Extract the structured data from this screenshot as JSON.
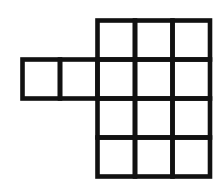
{
  "figure": {
    "name": "polyomino-grid-figure",
    "background_color": "#ffffff",
    "stroke_color": "#111111",
    "fill_color": "#ffffff",
    "stroke_width": 4.6,
    "cell_width": 37.5,
    "cell_height": 39,
    "total_cells": 14,
    "origin_x": 22.5,
    "origin_y": 20.5,
    "grid_columns": 5,
    "grid_rows": 4,
    "column_x": [
      22.5,
      60,
      97.5,
      135,
      172.5,
      210
    ],
    "row_y": [
      20.5,
      59.5,
      98.5,
      137.5,
      176.5
    ],
    "occupancy": [
      [
        0,
        0,
        1,
        1,
        1
      ],
      [
        1,
        1,
        1,
        1,
        1
      ],
      [
        0,
        0,
        1,
        1,
        1
      ],
      [
        0,
        0,
        1,
        1,
        1
      ]
    ],
    "cells": [
      {
        "label": "r1c3",
        "row": 0,
        "col": 2
      },
      {
        "label": "r1c4",
        "row": 0,
        "col": 3
      },
      {
        "label": "r1c5",
        "row": 0,
        "col": 4
      },
      {
        "label": "r2c1",
        "row": 1,
        "col": 0
      },
      {
        "label": "r2c2",
        "row": 1,
        "col": 1
      },
      {
        "label": "r2c3",
        "row": 1,
        "col": 2
      },
      {
        "label": "r2c4",
        "row": 1,
        "col": 3
      },
      {
        "label": "r2c5",
        "row": 1,
        "col": 4
      },
      {
        "label": "r3c3",
        "row": 2,
        "col": 2
      },
      {
        "label": "r3c4",
        "row": 2,
        "col": 3
      },
      {
        "label": "r3c5",
        "row": 2,
        "col": 4
      },
      {
        "label": "r4c3",
        "row": 3,
        "col": 2
      },
      {
        "label": "r4c4",
        "row": 3,
        "col": 3
      },
      {
        "label": "r4c5",
        "row": 3,
        "col": 4
      }
    ]
  }
}
